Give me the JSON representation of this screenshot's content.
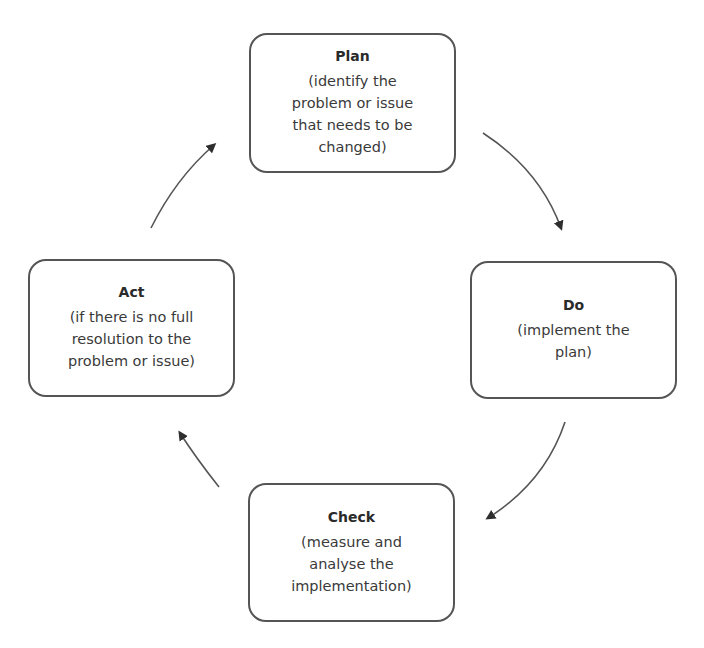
{
  "diagram": {
    "type": "cycle",
    "nodes": [
      {
        "id": "plan",
        "title": "Plan",
        "description": "(identify the\nproblem or issue\nthat needs to be\nchanged)"
      },
      {
        "id": "do",
        "title": "Do",
        "description": "(implement the\nplan)"
      },
      {
        "id": "check",
        "title": "Check",
        "description": "(measure and\nanalyse the\nimplementation)"
      },
      {
        "id": "act",
        "title": "Act",
        "description": "(if there is no full\nresolution to the\nproblem or issue)"
      }
    ],
    "edges": [
      {
        "from": "plan",
        "to": "do"
      },
      {
        "from": "do",
        "to": "check"
      },
      {
        "from": "check",
        "to": "act"
      },
      {
        "from": "act",
        "to": "plan"
      }
    ],
    "colors": {
      "border": "#555555",
      "text": "#333333",
      "arrow": "#444444",
      "background": "#ffffff"
    }
  }
}
